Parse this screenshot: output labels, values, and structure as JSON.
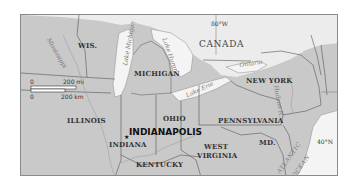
{
  "map": {
    "countries": [
      "CANADA"
    ],
    "states": {
      "wis": "WIS.",
      "michigan": "MICHIGAN",
      "new_york": "NEW YORK",
      "illinois": "ILLINOIS",
      "ohio": "OHIO",
      "pennsylvania": "PENNSYLVANIA",
      "indiana": "INDIANA",
      "kentucky": "KENTUCKY",
      "west": "WEST",
      "virginia": "VIRGINIA",
      "md": "MD."
    },
    "water": {
      "lake_michigan": "Lake Michigan",
      "lake_huron": "Lake Huron",
      "lake_erie": "Lake Erie",
      "lake_ontario": "Ontario",
      "mississippi": "Mississippi",
      "hudson": "Hudson R.",
      "atlantic1": "ATLANTIC",
      "atlantic2": "OCEAN",
      "ohio_river": "Ohio"
    },
    "city": {
      "name": "INDIANAPOLIS",
      "marker": "★"
    },
    "coordinates": {
      "longitude": "80°W",
      "latitude": "40°N"
    },
    "scale": {
      "zero_mi": "0",
      "mi_label": "200 mi",
      "zero_km": "0",
      "km_label": "200 km"
    },
    "colors": {
      "land_us": "#c9c9c9",
      "land_canada": "#ececec",
      "water": "#f4f4f4",
      "border": "#555555"
    }
  }
}
